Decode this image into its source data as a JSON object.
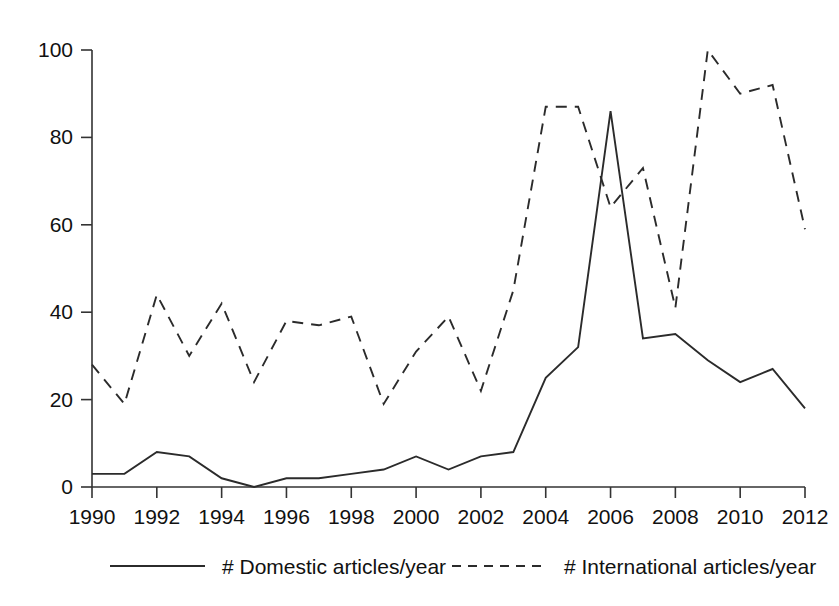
{
  "chart_data": {
    "type": "line",
    "title": "",
    "subtitle": "",
    "xlabel": "",
    "ylabel": "",
    "x": [
      1990,
      1991,
      1992,
      1993,
      1994,
      1995,
      1996,
      1997,
      1998,
      1999,
      2000,
      2001,
      2002,
      2003,
      2004,
      2005,
      2006,
      2007,
      2008,
      2009,
      2010,
      2011,
      2012
    ],
    "xlim": [
      1990,
      2012
    ],
    "ylim": [
      0,
      100
    ],
    "x_tick_labels": [
      "1990",
      "1992",
      "1994",
      "1996",
      "1998",
      "2000",
      "2002",
      "2004",
      "2006",
      "2008",
      "2010",
      "2012"
    ],
    "x_ticks": [
      1990,
      1992,
      1994,
      1996,
      1998,
      2000,
      2002,
      2004,
      2006,
      2008,
      2010,
      2012
    ],
    "y_ticks": [
      0,
      20,
      40,
      60,
      80,
      100
    ],
    "y_tick_labels": [
      "0",
      "20",
      "40",
      "60",
      "80",
      "100"
    ],
    "grid": false,
    "legend_position": "bottom",
    "series": [
      {
        "name": "# Domestic articles/year",
        "style": "solid",
        "color": "#2b2b2b",
        "values": [
          3,
          3,
          8,
          7,
          2,
          0,
          2,
          2,
          3,
          4,
          7,
          4,
          7,
          8,
          25,
          32,
          86,
          34,
          35,
          29,
          24,
          27,
          18
        ]
      },
      {
        "name": "# International articles/year",
        "style": "dashed",
        "color": "#2b2b2b",
        "values": [
          28,
          19,
          44,
          30,
          42,
          24,
          38,
          37,
          39,
          19,
          31,
          39,
          22,
          45,
          87,
          87,
          64,
          73,
          41,
          100,
          90,
          92,
          59
        ]
      }
    ],
    "legend": [
      {
        "label": "# Domestic articles/year",
        "style": "solid"
      },
      {
        "label": "# International articles/year",
        "style": "dashed"
      }
    ]
  }
}
